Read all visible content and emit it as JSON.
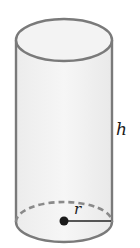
{
  "figure": {
    "type": "cylinder",
    "labels": {
      "height": "h",
      "radius": "r"
    },
    "colors": {
      "outline": "#7a7a7a",
      "fill": "#f1f1f1",
      "radius_line": "#222222",
      "center_dot": "#1a1a1a",
      "dashed_back_edge": "#8a8a8a"
    }
  }
}
